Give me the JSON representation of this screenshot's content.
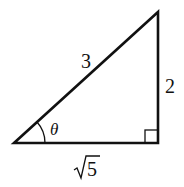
{
  "figure": {
    "type": "right-triangle",
    "hypotenuse_label": "3",
    "opposite_label": "2",
    "adjacent_radicand": "5",
    "adjacent_label": "√5",
    "angle_label": "θ",
    "right_angle_marker": true,
    "stroke_color": "#111111"
  }
}
